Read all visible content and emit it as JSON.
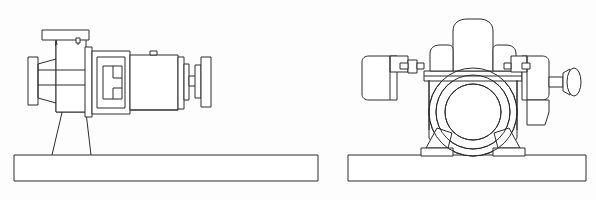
{
  "drawing": {
    "kind": "technical-line-drawing",
    "subject": "centrifugal-pump-assembly",
    "sheet_width": 596,
    "sheet_height": 200,
    "background_color": "#fdfdfd",
    "line_color": "#2c2c2c",
    "line_width": 1,
    "views": [
      {
        "id": "side-elevation",
        "name": "side-elevation-view",
        "position": "left",
        "components": [
          "discharge-flange-top",
          "volute-casing",
          "suction-flange-left",
          "pump-pedestal",
          "bearing-frame",
          "motor-body",
          "terminal-box",
          "coupling-shaft-end",
          "base-plate"
        ]
      },
      {
        "id": "end-elevation",
        "name": "end-elevation-view",
        "position": "right",
        "components": [
          "discharge-nozzle-top",
          "split-case-flange",
          "volute-casing-circles",
          "bearing-housing-left",
          "bearing-housing-right",
          "shaft-end-coupling",
          "support-legs",
          "mounting-feet",
          "base-plate"
        ]
      }
    ]
  }
}
